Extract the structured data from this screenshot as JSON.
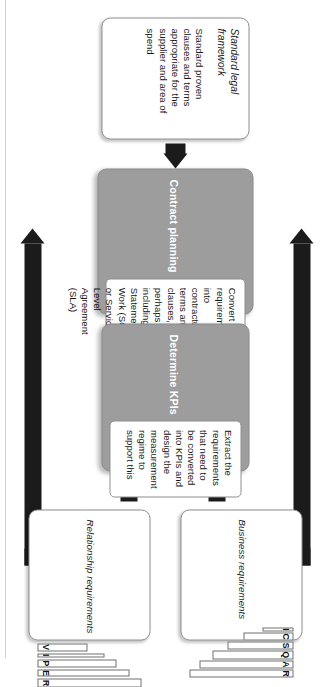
{
  "diagram": {
    "orientation": "rotated-90-clockwise",
    "colors": {
      "process_fill": "#9d9d9d",
      "process_title_text": "#ffffff",
      "card_fill": "#ffffff",
      "arrow": "#1b1b1b",
      "border": "#8e8e8e"
    }
  },
  "nodes": {
    "legal_framework": {
      "title": "Standard legal framework",
      "body": "Standard proven clauses and terms appropriate for the supplier and area of spend",
      "style": "plain"
    },
    "contract_planning": {
      "title": "Contract planning",
      "body": "Convert requirements into contractual terms and clauses, perhaps including a Statement of Work (SOW) or Service Level Agreement (SLA)",
      "style": "process"
    },
    "determine_kpis": {
      "title": "Determine KPIs",
      "body": "Extract the requirements that need to be converted into KPIs and design the measurement regime to support this",
      "style": "process"
    },
    "business_requirements": {
      "title": "Business requirements",
      "style": "plain-chart"
    },
    "relationship_requirements": {
      "title": "Relationship requirements",
      "style": "plain-chart"
    }
  },
  "chart_data": [
    {
      "id": "business-requirements-chart",
      "type": "bar",
      "title": "Business requirements",
      "orientation": "bars-hang-from-top",
      "categories": [
        "I",
        "C",
        "S",
        "Q",
        "A",
        "R"
      ],
      "values": [
        30,
        48,
        63,
        78,
        90,
        100
      ],
      "ylim": [
        0,
        100
      ],
      "xlabel": "",
      "ylabel": "",
      "grid": false,
      "legend": false
    },
    {
      "id": "relationship-requirements-chart",
      "type": "bar",
      "title": "Relationship requirements",
      "orientation": "bars-rise-from-bottom",
      "categories": [
        "V",
        "I",
        "P",
        "E",
        "R"
      ],
      "values": [
        48,
        64,
        76,
        88,
        100
      ],
      "ylim": [
        0,
        100
      ],
      "xlabel": "",
      "ylabel": "",
      "grid": false,
      "legend": false
    }
  ],
  "connections": [
    {
      "id": "legal-to-contract",
      "from": "Standard legal framework",
      "to": "Contract planning",
      "style": "block-arrow"
    },
    {
      "id": "kpi-to-contract-a",
      "from": "Determine KPIs",
      "to": "Contract planning",
      "style": "block-arrow"
    },
    {
      "id": "kpi-to-contract-b",
      "from": "Determine KPIs",
      "to": "Contract planning",
      "style": "block-arrow"
    },
    {
      "id": "business-to-kpi",
      "from": "Business requirements",
      "to": "Determine KPIs",
      "style": "block-arrow"
    },
    {
      "id": "relationship-to-kpi",
      "from": "Relationship requirements",
      "to": "Determine KPIs",
      "style": "block-arrow"
    },
    {
      "id": "business-to-contract",
      "from": "Business requirements",
      "to": "Contract planning",
      "style": "long-elbow-arrow"
    },
    {
      "id": "relationship-to-contract",
      "from": "Relationship requirements",
      "to": "Contract planning",
      "style": "long-elbow-arrow"
    }
  ]
}
